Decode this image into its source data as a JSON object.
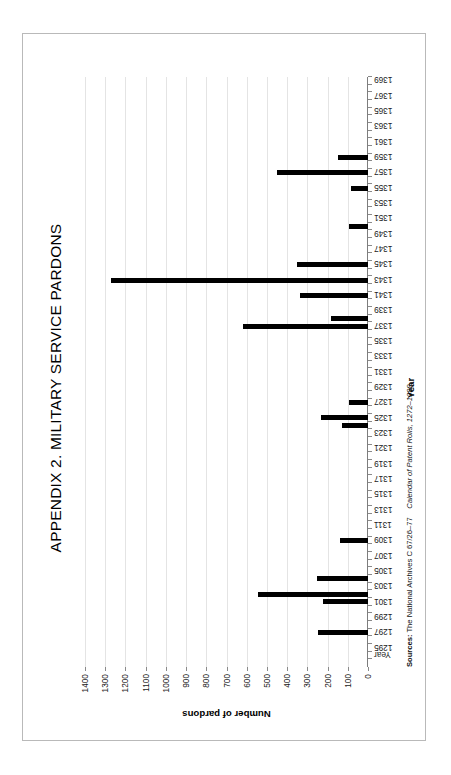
{
  "page": {
    "title": "APPENDIX 2.  MILITARY SERVICE PARDONS",
    "sources_label": "Sources:",
    "sources_archive": "The National Archives C 67/26–77",
    "sources_calendar": "Calendar of Patent Rolls, 1272–1399",
    "frame_color": "#b9b9b9",
    "bar_color": "#000000",
    "gridline_color": "#e4e4e4",
    "axis_color": "#7d7d7d"
  },
  "chart_data": {
    "type": "bar",
    "title": "APPENDIX 2.  MILITARY SERVICE PARDONS",
    "xlabel": "Year",
    "ylabel": "Number of pardons",
    "ylim": [
      0,
      1400
    ],
    "ytick_step": 100,
    "yticks": [
      0,
      100,
      200,
      300,
      400,
      500,
      600,
      700,
      800,
      900,
      1000,
      1100,
      1200,
      1300,
      1400
    ],
    "grid": true,
    "legend": "none",
    "orientation": "horizontal-bars-rotated-page",
    "xtick_labels_shown": [
      "Year",
      "1295",
      "1297",
      "1299",
      "1301",
      "1303",
      "1305",
      "1307",
      "1309",
      "1311",
      "1313",
      "1315",
      "1317",
      "1319",
      "1321",
      "1323",
      "1325",
      "1327",
      "1329",
      "1331",
      "1333",
      "1335",
      "1337",
      "1339",
      "1341",
      "1343",
      "1345",
      "1347",
      "1349",
      "1351",
      "1353",
      "1355",
      "1357",
      "1359",
      "1361",
      "1363",
      "1365",
      "1367",
      "1369"
    ],
    "categories": [
      1295,
      1296,
      1297,
      1298,
      1299,
      1300,
      1301,
      1302,
      1303,
      1304,
      1305,
      1306,
      1307,
      1308,
      1309,
      1310,
      1311,
      1312,
      1313,
      1314,
      1315,
      1316,
      1317,
      1318,
      1319,
      1320,
      1321,
      1322,
      1323,
      1324,
      1325,
      1326,
      1327,
      1328,
      1329,
      1330,
      1331,
      1332,
      1333,
      1334,
      1335,
      1336,
      1337,
      1338,
      1339,
      1340,
      1341,
      1342,
      1343,
      1344,
      1345,
      1346,
      1347,
      1348,
      1349,
      1350,
      1351,
      1352,
      1353,
      1354,
      1355,
      1356,
      1357,
      1358,
      1359,
      1360,
      1361,
      1362,
      1363,
      1364,
      1365,
      1366,
      1367,
      1368,
      1369,
      1370
    ],
    "values": [
      0,
      0,
      0,
      245,
      0,
      0,
      0,
      225,
      545,
      0,
      250,
      0,
      0,
      0,
      0,
      140,
      0,
      0,
      0,
      0,
      0,
      0,
      0,
      0,
      0,
      0,
      0,
      0,
      0,
      0,
      130,
      235,
      0,
      95,
      0,
      0,
      0,
      0,
      0,
      0,
      0,
      0,
      0,
      620,
      185,
      0,
      0,
      335,
      0,
      1270,
      0,
      350,
      0,
      0,
      0,
      0,
      95,
      0,
      0,
      0,
      0,
      85,
      0,
      450,
      0,
      150,
      0,
      0,
      0,
      0,
      0,
      0,
      0,
      0,
      0,
      0
    ]
  }
}
